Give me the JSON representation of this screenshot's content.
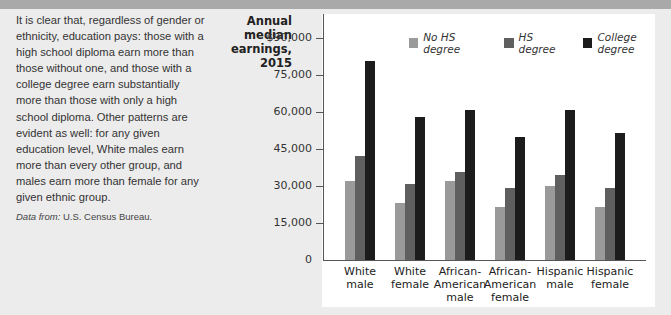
{
  "header": {
    "bar_color": "#a9a9a9"
  },
  "description": {
    "paragraph": "It is clear that, regardless of gender or ethnicity, education pays: those with a high school diploma earn more than those without one, and those with a college degree earn substantially more than those with only a high school diploma. Other patterns are evident as well: for any given education level, White males earn more than every other group, and males earn more than female for any given ethnic group.",
    "source_label": "Data from:",
    "source_value": "U.S. Census Bureau."
  },
  "chart_data": {
    "type": "bar",
    "title": "",
    "ylabel": "Annual median earnings, 2015",
    "ylabel_lines": [
      "Annual",
      "median",
      "earnings,",
      "2015"
    ],
    "xlabel": "",
    "ylim": [
      0,
      90000
    ],
    "yticks": [
      0,
      15000,
      30000,
      45000,
      60000,
      75000,
      90000
    ],
    "ytick_labels": [
      "0",
      "15,000",
      "30,000",
      "45,000",
      "60,000",
      "75,000",
      "$90,000"
    ],
    "grid": false,
    "legend_position": "top-right",
    "categories": [
      "White male",
      "White female",
      "African-American male",
      "African-American female",
      "Hispanic male",
      "Hispanic female"
    ],
    "category_lines": [
      [
        "White",
        "male"
      ],
      [
        "White",
        "female"
      ],
      [
        "African-",
        "American",
        "male"
      ],
      [
        "African-",
        "American",
        "female"
      ],
      [
        "Hispanic",
        "male"
      ],
      [
        "Hispanic",
        "female"
      ]
    ],
    "series": [
      {
        "name": "No HS degree",
        "color": "#9a9a9a",
        "values": [
          32000,
          23000,
          32000,
          21500,
          30000,
          21500
        ]
      },
      {
        "name": "HS degree",
        "color": "#5f5f5f",
        "values": [
          42000,
          31000,
          35500,
          29000,
          34500,
          29000
        ]
      },
      {
        "name": "College degree",
        "color": "#1c1c1c",
        "values": [
          80500,
          58000,
          61000,
          50000,
          61000,
          51500
        ]
      }
    ]
  }
}
